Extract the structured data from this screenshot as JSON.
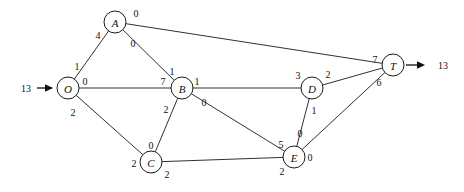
{
  "diagram": {
    "node_radius": 11,
    "colors": {
      "stroke": "#1a1a1a",
      "background": "#ffffff",
      "text": "#111111"
    },
    "nodes": [
      {
        "id": "O",
        "label": "O",
        "x": 68,
        "y": 88
      },
      {
        "id": "A",
        "label": "A",
        "x": 115,
        "y": 22
      },
      {
        "id": "B",
        "label": "B",
        "x": 182,
        "y": 88
      },
      {
        "id": "C",
        "label": "C",
        "x": 151,
        "y": 162
      },
      {
        "id": "D",
        "label": "D",
        "x": 312,
        "y": 88
      },
      {
        "id": "E",
        "label": "E",
        "x": 294,
        "y": 157
      },
      {
        "id": "T",
        "label": "T",
        "x": 393,
        "y": 65
      }
    ],
    "edges": [
      {
        "from": "O",
        "to": "A",
        "label_from": "1",
        "label_to": "4",
        "lx_from": 77,
        "ly_from": 66,
        "lx_to": 98,
        "ly_to": 35
      },
      {
        "from": "O",
        "to": "B",
        "label_from": "0",
        "label_to": "7",
        "lx_from": 85,
        "ly_from": 81,
        "lx_to": 163,
        "ly_to": 81
      },
      {
        "from": "O",
        "to": "C",
        "label_from": "2",
        "label_to": "2",
        "lx_from": 73,
        "ly_from": 112,
        "lx_to": 134,
        "ly_to": 163
      },
      {
        "from": "A",
        "to": "T",
        "label_from": "0",
        "label_to": "",
        "lx_from": 136,
        "ly_from": 13,
        "lx_to": 0,
        "ly_to": 0
      },
      {
        "from": "A",
        "to": "B",
        "label_from": "0",
        "label_to": "1",
        "lx_from": 133,
        "ly_from": 43,
        "lx_to": 172,
        "ly_to": 71
      },
      {
        "from": "B",
        "to": "D",
        "label_from": "1",
        "label_to": "3",
        "lx_from": 197,
        "ly_from": 81,
        "lx_to": 298,
        "ly_to": 75
      },
      {
        "from": "B",
        "to": "E",
        "label_from": "0",
        "label_to": "5",
        "lx_from": 204,
        "ly_from": 102,
        "lx_to": 281,
        "ly_to": 144
      },
      {
        "from": "B",
        "to": "C",
        "label_from": "2",
        "label_to": "0",
        "lx_from": 166,
        "ly_from": 109,
        "lx_to": 151,
        "ly_to": 145
      },
      {
        "from": "C",
        "to": "E",
        "label_from": "2",
        "label_to": "2",
        "lx_from": 167,
        "ly_from": 174,
        "lx_to": 282,
        "ly_to": 171
      },
      {
        "from": "D",
        "to": "E",
        "label_from": "1",
        "label_to": "0",
        "lx_from": 314,
        "ly_from": 110,
        "lx_to": 300,
        "ly_to": 133
      },
      {
        "from": "D",
        "to": "T",
        "label_from": "2",
        "label_to": "7",
        "lx_from": 328,
        "ly_from": 74,
        "lx_to": 375,
        "ly_to": 59
      },
      {
        "from": "E",
        "to": "T",
        "label_from": "0",
        "label_to": "6",
        "lx_from": 310,
        "ly_from": 157,
        "lx_to": 379,
        "ly_to": 82
      }
    ],
    "source_flow": {
      "value": "13",
      "x": 26,
      "y": 88
    },
    "sink_flow": {
      "value": "13",
      "x": 443,
      "y": 65
    },
    "watermarks": {
      "line1": "",
      "line2": "",
      "line3": ""
    }
  }
}
